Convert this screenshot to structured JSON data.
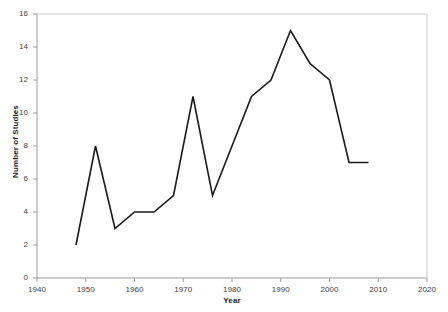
{
  "chart_data": {
    "type": "line",
    "title": "",
    "xlabel": "Year",
    "ylabel": "Number of Studies",
    "x": [
      1948,
      1952,
      1956,
      1960,
      1964,
      1968,
      1972,
      1976,
      1984,
      1988,
      1992,
      1996,
      2000,
      2004,
      2008
    ],
    "values": [
      2,
      8,
      3,
      4,
      4,
      5,
      11,
      5,
      11,
      12,
      15,
      13,
      12,
      7,
      7
    ],
    "series": [
      {
        "name": "Number of Studies",
        "values": [
          2,
          8,
          3,
          4,
          4,
          5,
          11,
          5,
          11,
          12,
          15,
          13,
          12,
          7,
          7
        ]
      }
    ],
    "xlim": [
      1940,
      2020
    ],
    "ylim": [
      0,
      16
    ],
    "xticks": [
      1940,
      1950,
      1960,
      1970,
      1980,
      1990,
      2000,
      2010,
      2020
    ],
    "xtick_labels": [
      "1940",
      "1950",
      "1960",
      "1970",
      "1980",
      "1990",
      "2000",
      "2010",
      "2020"
    ],
    "yticks": [
      0,
      2,
      4,
      6,
      8,
      10,
      12,
      14,
      16
    ],
    "ytick_labels": [
      "0",
      "2",
      "4",
      "6",
      "8",
      "10",
      "12",
      "14",
      "16"
    ],
    "grid": false,
    "legend": "none",
    "line_color": "#1a1a1a",
    "axis_color": "#999999",
    "background_color": "#ffffff"
  }
}
